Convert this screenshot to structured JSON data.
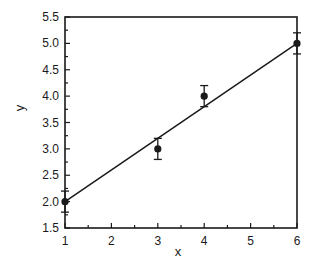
{
  "chart_data": {
    "type": "scatter",
    "title": "",
    "xlabel": "x",
    "ylabel": "y",
    "xlim": [
      1,
      6
    ],
    "ylim": [
      1.5,
      5.5
    ],
    "x_ticks": [
      "1",
      "2",
      "3",
      "4",
      "5",
      "6"
    ],
    "y_ticks": [
      "1.5",
      "2.0",
      "2.5",
      "3.0",
      "3.5",
      "4.0",
      "4.5",
      "5.0",
      "5.5"
    ],
    "grid": false,
    "legend": null,
    "series": [
      {
        "name": "data",
        "type": "scatter",
        "x": [
          1,
          3,
          4,
          6
        ],
        "y": [
          2.0,
          3.0,
          4.0,
          5.0
        ],
        "error": [
          0.2,
          0.2,
          0.2,
          0.2
        ]
      },
      {
        "name": "fit",
        "type": "line",
        "x": [
          1,
          6
        ],
        "y": [
          2.0,
          5.0
        ]
      }
    ]
  }
}
